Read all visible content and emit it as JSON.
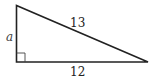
{
  "diagram": {
    "type": "right-triangle",
    "labels": {
      "vertical_leg": "a",
      "hypotenuse": "13",
      "horizontal_leg": "12"
    },
    "right_angle_marker": true,
    "colors": {
      "stroke": "#222222",
      "background": "#ffffff"
    }
  }
}
